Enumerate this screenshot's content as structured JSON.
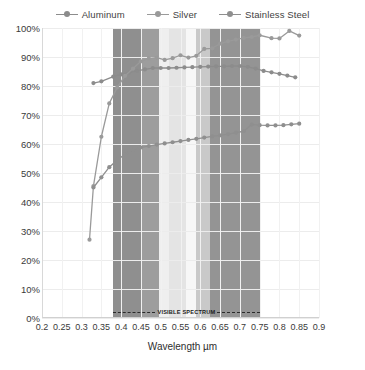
{
  "legend": {
    "position": "top-center",
    "items": [
      {
        "label": "Aluminum",
        "color": "#8c8c8c"
      },
      {
        "label": "Silver",
        "color": "#9a9a9a"
      },
      {
        "label": "Stainless Steel",
        "color": "#8f8f8f"
      }
    ]
  },
  "annotation": {
    "visible_spectrum_label": "VISIBLE SPECTRUM",
    "x_start": 0.38,
    "x_end": 0.75,
    "y": 2
  },
  "axes": {
    "y_ticks": [
      "0%",
      "10%",
      "20%",
      "30%",
      "40%",
      "50%",
      "60%",
      "70%",
      "80%",
      "90%",
      "100%"
    ],
    "x_ticks": [
      "0.2",
      "0.25",
      "0.3",
      "0.35",
      "0.4",
      "0.45",
      "0.5",
      "0.55",
      "0.6",
      "0.65",
      "0.7",
      "0.75",
      "0.8",
      "0.85",
      "0.9"
    ],
    "x_title": "Wavelength µm",
    "y_title": ""
  },
  "spectrum_bands": [
    {
      "name": "violet",
      "start": 0.38,
      "end": 0.45,
      "color": "#8f8f8f"
    },
    {
      "name": "blue",
      "start": 0.45,
      "end": 0.495,
      "color": "#9d9d9d"
    },
    {
      "name": "cyan",
      "start": 0.495,
      "end": 0.52,
      "color": "#efefef"
    },
    {
      "name": "green",
      "start": 0.52,
      "end": 0.565,
      "color": "#e4e4e4"
    },
    {
      "name": "yellow",
      "start": 0.565,
      "end": 0.59,
      "color": "#f7f7f7"
    },
    {
      "name": "orange",
      "start": 0.59,
      "end": 0.625,
      "color": "#c9c9c9"
    },
    {
      "name": "red",
      "start": 0.625,
      "end": 0.75,
      "color": "#949494"
    }
  ],
  "chart_data": {
    "type": "line",
    "title": "",
    "xlabel": "Wavelength µm",
    "ylabel": "",
    "xlim": [
      0.2,
      0.9
    ],
    "ylim": [
      0,
      100
    ],
    "x_tick_step": 0.05,
    "y_tick_step": 10,
    "grid": true,
    "legend_position": "top-center",
    "y_unit": "%",
    "series": [
      {
        "name": "Aluminum",
        "color": "#8c8c8c",
        "x": [
          0.33,
          0.35,
          0.38,
          0.4,
          0.42,
          0.44,
          0.46,
          0.48,
          0.5,
          0.52,
          0.54,
          0.56,
          0.58,
          0.6,
          0.62,
          0.64,
          0.66,
          0.68,
          0.7,
          0.72,
          0.74,
          0.76,
          0.78,
          0.8,
          0.82,
          0.84
        ],
        "y": [
          81.0,
          81.6,
          83.2,
          84.0,
          84.6,
          85.2,
          85.7,
          86.2,
          86.2,
          86.2,
          86.3,
          86.4,
          86.5,
          86.6,
          86.7,
          86.8,
          86.8,
          86.9,
          86.9,
          86.6,
          86.0,
          85.2,
          84.7,
          84.2,
          83.6,
          83.0
        ]
      },
      {
        "name": "Silver",
        "color": "#9a9a9a",
        "x": [
          0.32,
          0.33,
          0.35,
          0.37,
          0.39,
          0.41,
          0.43,
          0.45,
          0.47,
          0.49,
          0.51,
          0.53,
          0.55,
          0.57,
          0.59,
          0.61,
          0.63,
          0.65,
          0.67,
          0.69,
          0.71,
          0.73,
          0.75,
          0.78,
          0.8,
          0.825,
          0.85
        ],
        "y": [
          27.0,
          45.5,
          62.5,
          74.0,
          79.5,
          83.5,
          86.0,
          88.5,
          89.5,
          89.8,
          89.0,
          89.6,
          90.6,
          89.8,
          90.4,
          92.8,
          93.0,
          94.6,
          95.4,
          96.0,
          96.6,
          96.9,
          97.5,
          96.5,
          96.4,
          99.0,
          97.4
        ]
      },
      {
        "name": "Stainless Steel",
        "color": "#8f8f8f",
        "x": [
          0.33,
          0.35,
          0.37,
          0.39,
          0.41,
          0.43,
          0.45,
          0.47,
          0.49,
          0.51,
          0.53,
          0.55,
          0.57,
          0.59,
          0.61,
          0.63,
          0.65,
          0.67,
          0.69,
          0.71,
          0.73,
          0.75,
          0.77,
          0.79,
          0.81,
          0.83,
          0.85
        ],
        "y": [
          45.0,
          48.5,
          52.0,
          54.5,
          56.5,
          58.0,
          58.8,
          59.3,
          59.8,
          60.2,
          60.6,
          61.0,
          61.4,
          61.8,
          62.2,
          62.6,
          63.0,
          63.4,
          63.9,
          64.4,
          66.7,
          66.5,
          66.4,
          66.4,
          66.5,
          66.8,
          67.0
        ]
      }
    ]
  }
}
